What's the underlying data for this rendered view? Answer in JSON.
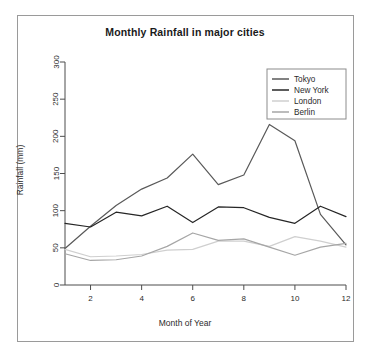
{
  "chart_data": {
    "type": "line",
    "title": "Monthly Rainfall in major cities",
    "xlabel": "Month of Year",
    "ylabel": "Rainfall (mm)",
    "x": [
      1,
      2,
      3,
      4,
      5,
      6,
      7,
      8,
      9,
      10,
      11,
      12
    ],
    "xlim": [
      1,
      12
    ],
    "ylim": [
      0,
      300
    ],
    "xticks": [
      "2",
      "4",
      "6",
      "8",
      "10",
      "12"
    ],
    "xtick_values": [
      2,
      4,
      6,
      8,
      10,
      12
    ],
    "yticks": [
      "0",
      "50",
      "100",
      "150",
      "200",
      "250",
      "300"
    ],
    "ytick_values": [
      0,
      50,
      100,
      150,
      200,
      250,
      300
    ],
    "grid": false,
    "legend_position": "top-right",
    "series": [
      {
        "name": "Tokyo",
        "color": "#595959",
        "values": [
          49,
          79,
          107,
          129,
          144,
          176,
          135,
          148,
          216,
          194,
          95,
          54
        ]
      },
      {
        "name": "New York",
        "color": "#262626",
        "values": [
          83,
          78,
          98,
          93,
          106,
          84,
          105,
          104,
          91,
          83,
          106,
          92
        ]
      },
      {
        "name": "London",
        "color": "#cfcfcf",
        "values": [
          48,
          38,
          39,
          41,
          47,
          48,
          59,
          59,
          52,
          65,
          59,
          51
        ]
      },
      {
        "name": "Berlin",
        "color": "#a6a6a6",
        "values": [
          42,
          33,
          34,
          39,
          52,
          70,
          60,
          62,
          51,
          40,
          51,
          56
        ]
      }
    ]
  },
  "legend": {
    "entries": [
      "Tokyo",
      "New York",
      "London",
      "Berlin"
    ]
  }
}
